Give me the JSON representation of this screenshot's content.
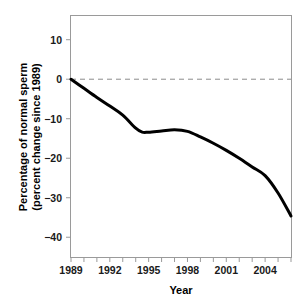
{
  "chart_data": {
    "type": "line",
    "title": "",
    "xlabel": "Year",
    "ylabel": "Percentage of normal sperm\n(percent change since 1989)",
    "ylabel_line1": "Percentage of normal sperm",
    "ylabel_line2": "(percent change since 1989)",
    "xlim": [
      1989,
      2006
    ],
    "ylim": [
      -45,
      16
    ],
    "grid": false,
    "legend": null,
    "x_tick_labels": [
      "1989",
      "1992",
      "1995",
      "1998",
      "2001",
      "2004"
    ],
    "x_tick_values": [
      1989,
      1992,
      1995,
      1998,
      2001,
      2004
    ],
    "x_minor_ticks": [
      1989,
      1990,
      1991,
      1992,
      1993,
      1994,
      1995,
      1996,
      1997,
      1998,
      1999,
      2000,
      2001,
      2002,
      2003,
      2004,
      2005,
      2006
    ],
    "y_tick_labels": [
      "10",
      "0",
      "−10",
      "−20",
      "−30",
      "−40"
    ],
    "y_tick_values": [
      10,
      0,
      -10,
      -20,
      -30,
      -40
    ],
    "reference_line": {
      "value": 0,
      "style": "dashed",
      "color": "#8c8c8c"
    },
    "series": [
      {
        "name": "Percent change in normal sperm since 1989",
        "color": "#000000",
        "line_width": 3,
        "x": [
          1989,
          1990,
          1991,
          1992,
          1993,
          1994,
          1994.5,
          1995,
          1996,
          1997,
          1998,
          1999,
          2000,
          2001,
          2002,
          2003,
          2004,
          2005,
          2006
        ],
        "values": [
          0,
          -2.3,
          -4.6,
          -6.8,
          -9.1,
          -12.4,
          -13.4,
          -13.4,
          -13.1,
          -12.8,
          -13.2,
          -14.6,
          -16.2,
          -18.0,
          -20.0,
          -22.2,
          -24.4,
          -28.8,
          -34.6
        ]
      }
    ],
    "axes_color": "#9a9a9a",
    "plot_background": "#ffffff"
  }
}
